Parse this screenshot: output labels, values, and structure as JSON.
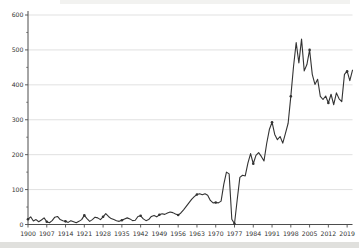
{
  "chart_data": {
    "type": "line",
    "title": "",
    "xlabel": "",
    "ylabel": "",
    "legend": "none",
    "grid": "horizontal",
    "x_start": 1900,
    "x_end": 2021,
    "ylim": [
      0,
      600
    ],
    "yticks": [
      0,
      100,
      200,
      300,
      400,
      500,
      600
    ],
    "y_minor_step": 50,
    "xticks": [
      1900,
      1907,
      1914,
      1921,
      1928,
      1935,
      1942,
      1949,
      1956,
      1963,
      1970,
      1977,
      1984,
      1991,
      1998,
      2005,
      2012,
      2019
    ],
    "marker_every": 7,
    "x": [
      1900,
      1901,
      1902,
      1903,
      1904,
      1905,
      1906,
      1907,
      1908,
      1909,
      1910,
      1911,
      1912,
      1913,
      1914,
      1915,
      1916,
      1917,
      1918,
      1919,
      1920,
      1921,
      1922,
      1923,
      1924,
      1925,
      1926,
      1927,
      1928,
      1929,
      1930,
      1931,
      1932,
      1933,
      1934,
      1935,
      1936,
      1937,
      1938,
      1939,
      1940,
      1941,
      1942,
      1943,
      1944,
      1945,
      1946,
      1947,
      1948,
      1949,
      1950,
      1951,
      1952,
      1953,
      1954,
      1955,
      1956,
      1957,
      1958,
      1959,
      1960,
      1961,
      1962,
      1963,
      1964,
      1965,
      1966,
      1967,
      1968,
      1969,
      1970,
      1971,
      1972,
      1973,
      1974,
      1975,
      1976,
      1977,
      1978,
      1979,
      1980,
      1981,
      1982,
      1983,
      1984,
      1985,
      1986,
      1987,
      1988,
      1989,
      1990,
      1991,
      1992,
      1993,
      1994,
      1995,
      1996,
      1997,
      1998,
      1999,
      2000,
      2001,
      2002,
      2003,
      2004,
      2005,
      2006,
      2007,
      2008,
      2009,
      2010,
      2011,
      2012,
      2013,
      2014,
      2015,
      2016,
      2017,
      2018,
      2019,
      2020,
      2021
    ],
    "values": [
      15,
      22,
      10,
      14,
      8,
      13,
      19,
      8,
      5,
      11,
      21,
      23,
      14,
      11,
      9,
      6,
      11,
      8,
      5,
      9,
      14,
      26,
      17,
      9,
      14,
      21,
      19,
      14,
      22,
      31,
      23,
      17,
      14,
      11,
      9,
      12,
      16,
      19,
      16,
      11,
      12,
      23,
      25,
      16,
      11,
      14,
      23,
      26,
      22,
      28,
      31,
      29,
      33,
      36,
      34,
      30,
      27,
      33,
      42,
      52,
      62,
      72,
      80,
      86,
      88,
      85,
      88,
      84,
      69,
      62,
      63,
      62,
      67,
      115,
      150,
      145,
      15,
      2,
      70,
      135,
      141,
      139,
      176,
      203,
      174,
      198,
      206,
      195,
      182,
      232,
      272,
      293,
      258,
      243,
      252,
      233,
      261,
      290,
      367,
      452,
      521,
      463,
      531,
      440,
      458,
      500,
      430,
      401,
      416,
      367,
      358,
      368,
      348,
      373,
      343,
      377,
      360,
      352,
      430,
      439,
      412,
      442
    ],
    "line_color": "#333333",
    "marker_color": "#333333",
    "grid_color": "#d9d9d9",
    "axis_color": "#4d4d4d",
    "tick_label_color": "#333333"
  },
  "page": {
    "background": "#ffffff",
    "footer_band_color": "#e0e0dd"
  }
}
